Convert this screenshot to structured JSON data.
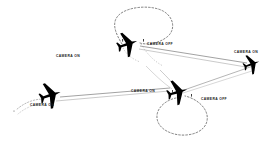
{
  "figure": {
    "type": "flight-path-diagram",
    "background_color": "#ffffff",
    "line_color": "#3a3a3a",
    "aircraft_color": "#000000",
    "label_color": "#1a1a1a"
  },
  "annotations": [
    {
      "id": "camera-on-upper",
      "text": "CAMERA ON",
      "x": 84,
      "y": 57,
      "align": "right"
    },
    {
      "id": "camera-off-upper",
      "text": "CAMERA OFF",
      "x": 147,
      "y": 45,
      "align": "left"
    },
    {
      "id": "camera-on-lower",
      "text": "CAMERA ON",
      "x": 131,
      "y": 92,
      "align": "left"
    },
    {
      "id": "camera-off-lower",
      "text": "CAMERA OFF",
      "x": 201,
      "y": 100,
      "align": "left"
    },
    {
      "id": "camera-on-right",
      "text": "CAMERA ON",
      "x": 234,
      "y": 52,
      "align": "left"
    },
    {
      "id": "camera-on-left",
      "text": "CAMERA ON",
      "x": 30,
      "y": 106,
      "align": "left"
    }
  ],
  "aircraft": [
    {
      "id": "aircraft-upper-center",
      "x": 128,
      "y": 44,
      "rotation": -18,
      "scale": 1.0
    },
    {
      "id": "aircraft-left",
      "x": 51,
      "y": 95,
      "rotation": -18,
      "scale": 1.05
    },
    {
      "id": "aircraft-lower-center",
      "x": 178,
      "y": 92,
      "rotation": -16,
      "scale": 1.0
    },
    {
      "id": "aircraft-right",
      "x": 252,
      "y": 64,
      "rotation": -20,
      "scale": 0.85
    }
  ],
  "paths": {
    "upper_loop": "Dashed elliptical turn, upper centre of frame",
    "lower_loop": "Dashed elliptical turn, lower centre-right of frame",
    "survey_leg_lower_left": "Straight survey run descending to the lower left",
    "survey_leg_upper_right": "Straight survey run ascending to the upper right"
  }
}
